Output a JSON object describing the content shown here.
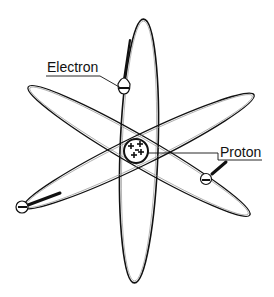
{
  "diagram": {
    "labels": {
      "electron": "Electron",
      "proton": "Proton"
    },
    "nucleus": {
      "cx": 136,
      "cy": 151,
      "r": 12,
      "charge_symbol": "+"
    },
    "orbits": [
      {
        "name": "vertical-orbit",
        "cx": 139,
        "cy": 151,
        "rx": 19,
        "ry": 132,
        "rotate": 2
      },
      {
        "name": "upper-left-orbit",
        "cx": 139,
        "cy": 151,
        "rx": 128,
        "ry": 15,
        "rotate": 30
      },
      {
        "name": "upper-right-orbit",
        "cx": 139,
        "cy": 151,
        "rx": 128,
        "ry": 15,
        "rotate": -26
      }
    ],
    "electrons": [
      {
        "cx": 124,
        "cy": 88,
        "symbol": "−"
      },
      {
        "cx": 206,
        "cy": 179,
        "symbol": "−"
      },
      {
        "cx": 22,
        "cy": 207,
        "symbol": "−"
      }
    ],
    "colors": {
      "stroke": "#111111",
      "background": "#ffffff",
      "soft_stroke": "#777777"
    }
  }
}
